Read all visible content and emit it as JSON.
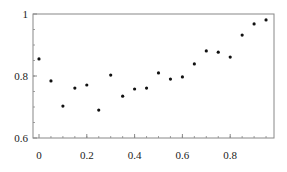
{
  "chart_data": {
    "type": "scatter",
    "title": "",
    "xlabel": "",
    "ylabel": "",
    "xlim": [
      -0.025,
      0.983
    ],
    "ylim": [
      0.6,
      1.0
    ],
    "grid": false,
    "legend": null,
    "x_ticks": [
      0,
      0.2,
      0.4,
      0.6,
      0.8
    ],
    "x_tick_labels": [
      "0",
      "0.2",
      "0.4",
      "0.6",
      "0.8"
    ],
    "y_ticks": [
      0.6,
      0.8,
      1.0
    ],
    "y_tick_labels": [
      "0.6",
      "0.8",
      "1"
    ],
    "series": [
      {
        "name": "points",
        "marker": "dot",
        "color": "#111111",
        "x": [
          0.0,
          0.05,
          0.1,
          0.15,
          0.2,
          0.25,
          0.3,
          0.35,
          0.4,
          0.45,
          0.5,
          0.55,
          0.6,
          0.65,
          0.7,
          0.75,
          0.8,
          0.85,
          0.9,
          0.95
        ],
        "y": [
          0.855,
          0.784,
          0.703,
          0.761,
          0.771,
          0.69,
          0.803,
          0.735,
          0.758,
          0.761,
          0.81,
          0.79,
          0.797,
          0.839,
          0.881,
          0.877,
          0.861,
          0.932,
          0.968,
          0.981
        ]
      }
    ]
  },
  "style": {
    "axis_color": "#888888",
    "point_color": "#111111",
    "text_color": "#222222"
  }
}
